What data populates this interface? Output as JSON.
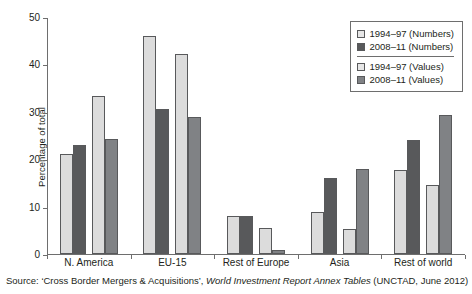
{
  "chart_data": {
    "type": "bar",
    "title": "",
    "xlabel": "",
    "ylabel": "Percentage of total",
    "ylim": [
      0,
      50
    ],
    "yticks": [
      0,
      10,
      20,
      30,
      40,
      50
    ],
    "grid": false,
    "legend_position": "top-right",
    "categories": [
      "N. America",
      "EU-15",
      "Rest of Europe",
      "Asia",
      "Rest of world"
    ],
    "series": [
      {
        "name": "1994–97 (Numbers)",
        "color": "#dcdcdc",
        "values": [
          21.0,
          46.0,
          8.0,
          8.8,
          17.8
        ]
      },
      {
        "name": "2008–11 (Numbers)",
        "color": "#58595b",
        "values": [
          23.0,
          30.6,
          8.0,
          16.1,
          24.0
        ]
      },
      {
        "name": "1994–97 (Values)",
        "color": "#dcdcdc",
        "values": [
          33.3,
          42.2,
          5.5,
          5.3,
          14.6
        ]
      },
      {
        "name": "2008–11 (Values)",
        "color": "#808285",
        "values": [
          24.3,
          29.0,
          0.8,
          18.0,
          29.3
        ]
      }
    ]
  },
  "legend": {
    "items": [
      {
        "label": "1994–97 (Numbers)"
      },
      {
        "label": "2008–11 (Numbers)"
      },
      {
        "label": "1994–97 (Values)"
      },
      {
        "label": "2008–11 (Values)"
      }
    ]
  },
  "source": {
    "prefix": "Source: ‘Cross Border Mergers & Acquisitions’, ",
    "italic": "World Investment Report Annex Tables",
    "suffix": " (UNCTAD, June 2012)"
  }
}
